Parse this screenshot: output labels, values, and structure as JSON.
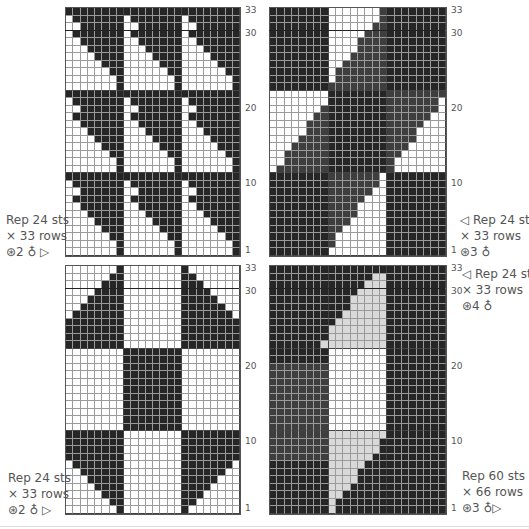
{
  "colors": {
    "white": "#ffffff",
    "dark": "#262626",
    "dark2": "#3e3e3e",
    "dark3": "#333333",
    "light": "#d9d9d9"
  },
  "charts": [
    {
      "id": "top-left",
      "x": 65,
      "y": 7,
      "cols": 24,
      "rows": 33,
      "cw": 7.25,
      "ch": 7.5,
      "row_labels": [
        {
          "row": 33,
          "text": "33"
        },
        {
          "row": 30,
          "text": "30"
        },
        {
          "row": 20,
          "text": "20"
        },
        {
          "row": 10,
          "text": "10"
        },
        {
          "row": 1,
          "text": "1"
        }
      ],
      "legend": {
        "x": 6,
        "y": 212,
        "lines": [
          "Rep 24 sts",
          "× 33 rows",
          "⊛2 ♁ ▷"
        ]
      }
    },
    {
      "id": "top-right",
      "x": 269,
      "y": 7,
      "cols": 24,
      "rows": 33,
      "cw": 7.33,
      "ch": 7.5,
      "row_labels": [
        {
          "row": 33,
          "text": "33"
        },
        {
          "row": 30,
          "text": "30"
        },
        {
          "row": 20,
          "text": "20"
        },
        {
          "row": 10,
          "text": "10"
        },
        {
          "row": 1,
          "text": "1"
        }
      ],
      "legend": {
        "x": 462,
        "y": 212,
        "lines": [
          "◁ Rep 24 sts",
          "× 33 rows",
          "⊛3 ♁"
        ]
      }
    },
    {
      "id": "bottom-left",
      "x": 65,
      "y": 265,
      "cols": 24,
      "rows": 33,
      "cw": 7.25,
      "ch": 7.5,
      "row_labels": [
        {
          "row": 33,
          "text": "33"
        },
        {
          "row": 30,
          "text": "30"
        },
        {
          "row": 20,
          "text": "20"
        },
        {
          "row": 10,
          "text": "10"
        },
        {
          "row": 1,
          "text": "1"
        }
      ],
      "legend": {
        "x": 8,
        "y": 470,
        "lines": [
          "Rep 24 sts",
          "× 33 rows",
          "⊛2 ♁ ▷"
        ]
      }
    },
    {
      "id": "bottom-right",
      "x": 269,
      "y": 265,
      "cols": 24,
      "rows": 33,
      "cw": 7.33,
      "ch": 7.5,
      "row_labels": [
        {
          "row": 33,
          "text": "33"
        },
        {
          "row": 30,
          "text": "30"
        },
        {
          "row": 20,
          "text": "20"
        },
        {
          "row": 10,
          "text": "10"
        },
        {
          "row": 1,
          "text": "1"
        }
      ],
      "legend": {
        "x": 462,
        "y": 468,
        "lines": [
          "Rep 60 sts",
          "× 66 rows",
          "⊛3 ♁▷"
        ]
      },
      "legend2": {
        "x": 462,
        "y": 265,
        "lines": [
          "◁ Rep 24 sts",
          "× 33 rows",
          "⊛4 ♁"
        ]
      }
    }
  ]
}
